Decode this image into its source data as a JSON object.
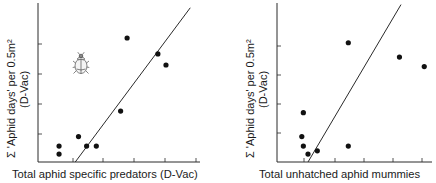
{
  "chart_data": [
    {
      "type": "scatter",
      "panel": "left",
      "title": "",
      "xlabel": "Total aphid specific predators (D-Vac)",
      "ylabel_line1": "Σ 'Aphid days' per 0.5m²",
      "ylabel_line2": "(D-Vac)",
      "x_tick_count": 5,
      "y_tick_count": 4,
      "tick_labels": "none",
      "grid": false,
      "icon": "ladybird-beetle",
      "points": [
        {
          "x": 0.13,
          "y": 0.1
        },
        {
          "x": 0.13,
          "y": 0.05
        },
        {
          "x": 0.25,
          "y": 0.16
        },
        {
          "x": 0.3,
          "y": 0.1
        },
        {
          "x": 0.36,
          "y": 0.1
        },
        {
          "x": 0.51,
          "y": 0.32
        },
        {
          "x": 0.55,
          "y": 0.78
        },
        {
          "x": 0.74,
          "y": 0.68
        },
        {
          "x": 0.79,
          "y": 0.61
        }
      ],
      "regression_line": {
        "x0": 0.23,
        "y0": 0.0,
        "x1": 0.94,
        "y1": 0.97
      }
    },
    {
      "type": "scatter",
      "panel": "right",
      "title": "",
      "xlabel": "Total unhatched aphid mummies",
      "ylabel_line1": "Σ 'Aphid days' per 0.5m²",
      "ylabel_line2": "(D-Vac)",
      "x_tick_count": 5,
      "y_tick_count": 4,
      "tick_labels": "none",
      "grid": false,
      "points": [
        {
          "x": 0.17,
          "y": 0.31
        },
        {
          "x": 0.16,
          "y": 0.16
        },
        {
          "x": 0.17,
          "y": 0.1
        },
        {
          "x": 0.2,
          "y": 0.05
        },
        {
          "x": 0.26,
          "y": 0.07
        },
        {
          "x": 0.46,
          "y": 0.75
        },
        {
          "x": 0.46,
          "y": 0.1
        },
        {
          "x": 0.79,
          "y": 0.66
        },
        {
          "x": 0.95,
          "y": 0.6
        }
      ],
      "regression_line": {
        "x0": 0.2,
        "y0": 0.0,
        "x1": 0.8,
        "y1": 0.99
      }
    }
  ]
}
